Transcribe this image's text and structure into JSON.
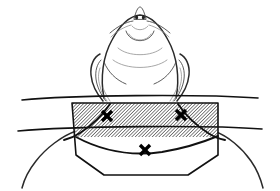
{
  "figure": {
    "domain_kind": "anatomical-line-drawing",
    "canvas": {
      "width": 280,
      "height": 191
    },
    "background_color": "#ffffff",
    "line_color": "#1a1a1a",
    "hatch_color": "#333333",
    "marker_color": "#000000"
  },
  "subject": {
    "view": "inferior-anterior view of head extended backwards, neck exposed",
    "parts": [
      {
        "id": "nose",
        "label": "nose with nostrils",
        "cx": 139,
        "cy": 13
      },
      {
        "id": "brow-left",
        "label": "left brow ridge",
        "cx": 122,
        "cy": 22
      },
      {
        "id": "brow-right",
        "label": "right brow ridge",
        "cx": 157,
        "cy": 22
      },
      {
        "id": "chin",
        "label": "chin / submental region",
        "cx": 140,
        "cy": 45
      },
      {
        "id": "jaw-left",
        "label": "left mandible border",
        "cx": 108,
        "cy": 55
      },
      {
        "id": "jaw-right",
        "label": "right mandible border",
        "cx": 171,
        "cy": 55
      },
      {
        "id": "ear-left",
        "label": "left ear",
        "cx": 98,
        "cy": 70
      },
      {
        "id": "ear-right",
        "label": "right ear",
        "cx": 181,
        "cy": 70
      },
      {
        "id": "shoulder-left",
        "label": "left shoulder slope",
        "cx": 30,
        "cy": 165
      },
      {
        "id": "shoulder-right",
        "label": "right shoulder slope",
        "cx": 250,
        "cy": 165
      }
    ]
  },
  "hatched_field": {
    "label": "hatched surgical field (anterior neck)",
    "shape": "parallelogram-box",
    "hatch_angle_deg": 45,
    "hatch_spacing_px": 2.4,
    "corners": [
      {
        "x": 72,
        "y": 103
      },
      {
        "x": 218,
        "y": 103
      },
      {
        "x": 218,
        "y": 137
      },
      {
        "x": 76,
        "y": 137
      }
    ]
  },
  "outline_field": {
    "label": "lower shield outline (clavicular / manubrium region)",
    "corners": [
      {
        "x": 72,
        "y": 103
      },
      {
        "x": 218,
        "y": 103
      },
      {
        "x": 218,
        "y": 155
      },
      {
        "x": 188,
        "y": 175
      },
      {
        "x": 104,
        "y": 175
      },
      {
        "x": 76,
        "y": 155
      }
    ]
  },
  "guide_lines": [
    {
      "id": "upper-horizontal",
      "label": "upper transverse reference line",
      "x1": 22,
      "y1": 100,
      "x2": 258,
      "y2": 98
    },
    {
      "id": "lower-horizontal",
      "label": "lower transverse reference line",
      "x1": 18,
      "y1": 131,
      "x2": 262,
      "y2": 129
    }
  ],
  "muscles": [
    {
      "id": "scm-left",
      "label": "left sternocleidomastoid border"
    },
    {
      "id": "scm-right",
      "label": "right sternocleidomastoid border"
    }
  ],
  "markers": [
    {
      "id": "marker-left",
      "label": "X landmark — left (mastoid / SCM upper)",
      "x": 107,
      "y": 116,
      "size": 9
    },
    {
      "id": "marker-right",
      "label": "X landmark — right (mastoid / SCM upper)",
      "x": 181,
      "y": 115,
      "size": 9
    },
    {
      "id": "marker-mid",
      "label": "X landmark — midline (suprasternal notch)",
      "x": 145,
      "y": 150,
      "size": 8
    }
  ]
}
